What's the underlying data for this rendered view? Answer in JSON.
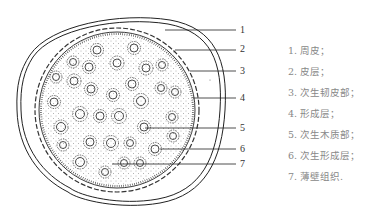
{
  "figure": {
    "type": "cross-section diagram"
  },
  "callouts": [
    {
      "num": "1",
      "x": 240,
      "y": 24
    },
    {
      "num": "2",
      "x": 240,
      "y": 43
    },
    {
      "num": "3",
      "x": 240,
      "y": 65
    },
    {
      "num": "4",
      "x": 240,
      "y": 92
    },
    {
      "num": "5",
      "x": 240,
      "y": 122
    },
    {
      "num": "6",
      "x": 240,
      "y": 143
    },
    {
      "num": "7",
      "x": 240,
      "y": 158
    }
  ],
  "legend": [
    "1. 周皮；",
    "2. 皮层；",
    "3. 次生韧皮部；",
    "4. 形成层；",
    "5. 次生木质部；",
    "6. 次生形成层；",
    "7. 薄壁组织."
  ],
  "colors": {
    "line": "#222222",
    "stipple": "#555555",
    "legend_text": "#888888"
  }
}
